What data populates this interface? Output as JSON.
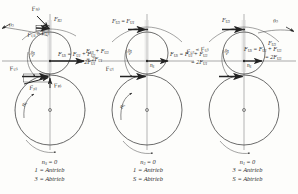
{
  "figure": {
    "kind": "planetary-gear-force-diagram",
    "panel_count": 3,
    "ink_color": "#2a2a2a",
    "paper_color": "#fdfdfb"
  },
  "panels": [
    {
      "id": "panel-1",
      "caption": {
        "condition": "n",
        "condition_sub": "S",
        "condition_rest": " = 0",
        "line1": "n",
        "line1_sub": "S",
        "line1_rest": " = 0",
        "line2": "1 = Antrieb",
        "line3": "3 = Abtrieb"
      },
      "speed_labels": [
        {
          "name": "n3-outer",
          "base": "n",
          "sub": "3"
        },
        {
          "name": "n1-inner",
          "base": "n",
          "sub": "1"
        }
      ],
      "forces_top": [
        {
          "name": "FN3",
          "base": "F",
          "sub": "N3"
        },
        {
          "name": "FR3",
          "base": "F",
          "sub": "R3"
        }
      ],
      "forces_bottom": [
        {
          "name": "FU1",
          "base": "F",
          "sub": "U1"
        },
        {
          "name": "FN1",
          "base": "F",
          "sub": "N1"
        },
        {
          "name": "FR1",
          "base": "F",
          "sub": "R1"
        }
      ],
      "fraction_left": {
        "num": "F",
        "num_sub": "U3",
        "num_rest": " = F",
        "num_sub2": "U1",
        "den": ""
      },
      "fraction_right": {
        "num_a": "F",
        "num_a_sub": "US",
        "num_mid": " = F",
        "num_b_sub": "U1",
        "num_tail": " + F",
        "num_c_sub": "U3",
        "den": "= 2F",
        "den_sub": "U1"
      },
      "angle_label": {
        "base": "2",
        "sub": ""
      }
    },
    {
      "id": "panel-2",
      "caption": {
        "line1": "n",
        "line1_sub": "3",
        "line1_rest": " = 0",
        "line2": "1 = Antrieb",
        "line3": "S = Abtrieb"
      },
      "speed_labels": [
        {
          "name": "nS-center",
          "base": "n",
          "sub": "S"
        },
        {
          "name": "n1-inner",
          "base": "n",
          "sub": "1"
        }
      ],
      "top_equation": {
        "base": "F",
        "sub": "U3",
        "rest": " = F",
        "sub2": "U1"
      },
      "forces_bottom": [
        {
          "name": "FU1",
          "base": "F",
          "sub": "U1"
        }
      ],
      "fraction_left": {
        "num": "F",
        "num_sub": "U1",
        "num_rest": " + F",
        "num_sub2": "U3",
        "den": "= 2F",
        "den_sub": "U1"
      },
      "fraction_right": {
        "num": "F",
        "num_sub": "US",
        "num_rest": " = F",
        "num_sub2": "U1",
        "num_tail": " + F",
        "num_sub3": "U3",
        "den": "= 2F",
        "den_sub": "U1"
      }
    },
    {
      "id": "panel-3",
      "caption": {
        "line1": "n",
        "line1_sub": "1",
        "line1_rest": " = 0",
        "line2": "3 = Antrieb",
        "line3": "S = Abtrieb"
      },
      "speed_labels": [
        {
          "name": "n3-outer",
          "base": "n",
          "sub": "3"
        },
        {
          "name": "nS-center",
          "base": "n",
          "sub": "S"
        }
      ],
      "top_force": {
        "base": "F",
        "sub": "U3"
      },
      "left_force": {
        "base": "F",
        "sub": "U1",
        "rest": " = F",
        "sub2": "U3"
      },
      "right_force": {
        "base": "F",
        "sub": "U3"
      },
      "fraction_right": {
        "num": "F",
        "num_sub": "US",
        "num_rest": " = F",
        "num_sub2": "U1",
        "num_tail": " + F",
        "num_sub3": "U3",
        "den": "= 2F",
        "den_sub": "U3"
      },
      "fraction_den_alt": {
        "den": "= 2F",
        "den_sub": "U3"
      }
    }
  ],
  "glossary": {
    "antrieb": "Antrieb",
    "abtrieb": "Abtrieb",
    "sun": "1",
    "planet": "3",
    "carrier": "S"
  }
}
